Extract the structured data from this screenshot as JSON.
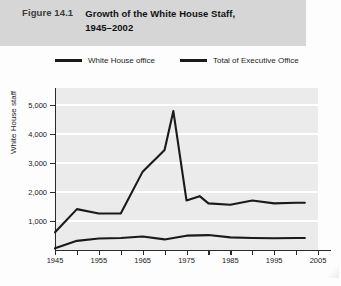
{
  "figure": {
    "number": "Figure 14.1",
    "title_line1": "Growth of the White House Staff,",
    "title_line2": "1945–2002"
  },
  "legend": {
    "items": [
      {
        "label": "White House office",
        "color": "#1a1a1a"
      },
      {
        "label": "Total of Executive Office",
        "color": "#1a1a1a"
      }
    ]
  },
  "bottom_caption": {
    "text": ""
  },
  "chart_data": {
    "type": "line",
    "title": "Growth of the White House Staff, 1945–2002",
    "xlabel": "",
    "ylabel": "White House staff",
    "xlim": [
      1945,
      2005
    ],
    "ylim": [
      0,
      5600
    ],
    "grid": true,
    "legend_position": "top",
    "y_ticks": [
      1000,
      2000,
      3000,
      4000,
      5000
    ],
    "y_tick_labels": [
      "1,000",
      "2,000",
      "3,000",
      "4,000",
      "5,000"
    ],
    "x_ticks": [
      1945,
      1950,
      1955,
      1960,
      1965,
      1970,
      1975,
      1980,
      1985,
      1990,
      1995,
      2000,
      2005
    ],
    "x_tick_labels": [
      "1945",
      "",
      "1955",
      "",
      "1965",
      "",
      "1975",
      "",
      "1985",
      "",
      "1995",
      "",
      "2005"
    ],
    "series": [
      {
        "name": "Total of Executive Office",
        "color": "#1a1a1a",
        "x": [
          1945,
          1950,
          1955,
          1960,
          1965,
          1970,
          1972,
          1975,
          1978,
          1980,
          1985,
          1990,
          1995,
          2000,
          2002
        ],
        "values": [
          600,
          1400,
          1250,
          1250,
          2700,
          3450,
          4800,
          1700,
          1850,
          1600,
          1550,
          1700,
          1600,
          1620,
          1620
        ]
      },
      {
        "name": "White House office",
        "color": "#1a1a1a",
        "x": [
          1945,
          1950,
          1955,
          1960,
          1965,
          1970,
          1975,
          1980,
          1985,
          1990,
          1995,
          2000,
          2002
        ],
        "values": [
          40,
          300,
          380,
          400,
          450,
          350,
          480,
          500,
          420,
          400,
          390,
          400,
          400
        ]
      }
    ]
  }
}
